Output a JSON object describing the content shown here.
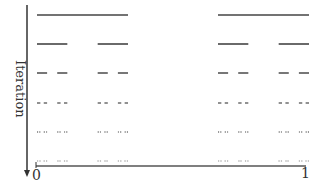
{
  "diagram": {
    "type": "iterative-subdivision",
    "y_axis": {
      "label": "Iteration",
      "direction": "down"
    },
    "x_axis": {
      "ticks": [
        "0",
        "1"
      ]
    },
    "colors": {
      "line": "#333333",
      "background": "#ffffff"
    },
    "groups": [
      {
        "x_start": 37,
        "x_end": 128
      },
      {
        "x_start": 218,
        "x_end": 309
      }
    ],
    "rows": [
      {
        "iteration": 1,
        "y": 15,
        "pattern": [
          [
            0,
            1
          ]
        ]
      },
      {
        "iteration": 2,
        "y": 44,
        "pattern": [
          [
            0,
            0.33
          ],
          [
            0.66,
            1
          ]
        ]
      },
      {
        "iteration": 3,
        "y": 73,
        "pattern": [
          [
            0,
            0.11
          ],
          [
            0.22,
            0.33
          ],
          [
            0.66,
            0.77
          ],
          [
            0.88,
            1
          ]
        ]
      },
      {
        "iteration": 4,
        "y": 103,
        "pattern": "dashed-fine"
      },
      {
        "iteration": 5,
        "y": 132,
        "pattern": "dashed-finer"
      },
      {
        "iteration": 6,
        "y": 161,
        "pattern": "dashed-finest"
      }
    ]
  }
}
